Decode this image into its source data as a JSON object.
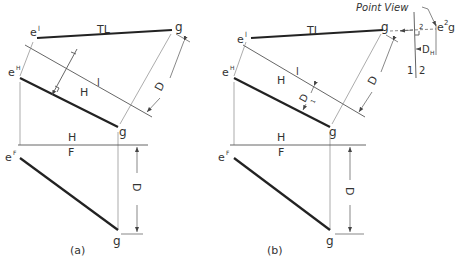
{
  "figure": {
    "panels": [
      {
        "id": "a",
        "caption": "(a)",
        "labels": {
          "e_top": "e",
          "e_top_sup": "l",
          "g_top": "g",
          "true_length": "TL",
          "e_horizontal": "e",
          "e_horizontal_sup": "H",
          "g_horizontal": "g",
          "fold_H1_top": "H",
          "fold_H1_bottom": "l",
          "fold_HF_top": "H",
          "fold_HF_bottom": "F",
          "e_front": "e",
          "e_front_sup": "F",
          "g_front": "g",
          "dim_aux": "D",
          "dim_front": "D"
        }
      },
      {
        "id": "b",
        "caption": "(b)",
        "labels": {
          "e_top": "e",
          "e_top_sup": "l",
          "g_top": "g",
          "true_length": "TL",
          "e_horizontal": "e",
          "e_horizontal_sup": "H",
          "g_horizontal": "g",
          "fold_H1_top": "H",
          "fold_H1_bottom": "l",
          "dim_d1": "D",
          "dim_d1_sub": "1",
          "dim_aux": "D",
          "fold_HF_top": "H",
          "fold_HF_bottom": "F",
          "e_front": "e",
          "e_front_sup": "F",
          "g_front": "g",
          "dim_front": "D",
          "point_view": "Point View",
          "point_view_label": "e",
          "point_view_sup": "2",
          "point_view_g": "g",
          "fold_12_left": "1",
          "fold_12_right": "2",
          "fold_12_top": "2",
          "dim_dh": "D",
          "dim_dh_sub": "H"
        }
      }
    ]
  }
}
